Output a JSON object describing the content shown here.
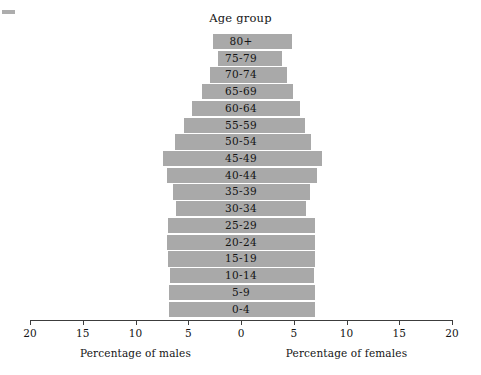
{
  "chart_data": {
    "type": "bar",
    "subtype": "population-pyramid",
    "title": "Age group",
    "xlabel_left": "Percentage of males",
    "xlabel_right": "Percentage of females",
    "ylabel": "",
    "grid": false,
    "legend": null,
    "axis": {
      "center_value": 0,
      "max_value": 20,
      "tick_values": [
        20,
        15,
        10,
        5,
        0,
        5,
        10,
        15,
        20
      ],
      "tick_labels": [
        "20",
        "15",
        "10",
        "5",
        "0",
        "5",
        "10",
        "15",
        "20"
      ],
      "units": "percent"
    },
    "categories": [
      "80+",
      "75-79",
      "70-74",
      "65-69",
      "60-64",
      "55-59",
      "50-54",
      "45-49",
      "40-44",
      "35-39",
      "30-34",
      "25-29",
      "20-24",
      "15-19",
      "10-14",
      "5-9",
      "0-4"
    ],
    "series": [
      {
        "name": "Percentage of males",
        "side": "left",
        "values": [
          2.7,
          2.2,
          2.9,
          3.7,
          4.6,
          5.4,
          6.3,
          7.4,
          7.0,
          6.4,
          6.2,
          6.9,
          7.0,
          6.9,
          6.7,
          6.8,
          6.8
        ]
      },
      {
        "name": "Percentage of females",
        "side": "right",
        "values": [
          4.8,
          3.9,
          4.4,
          4.9,
          5.6,
          6.1,
          6.6,
          7.7,
          7.2,
          6.5,
          6.2,
          7.0,
          7.0,
          7.0,
          6.9,
          7.0,
          7.0
        ]
      }
    ],
    "colors": {
      "bar": "#a9a9a9",
      "axis": "#3c3c3c",
      "text": "#141414",
      "background": "#ffffff"
    }
  }
}
